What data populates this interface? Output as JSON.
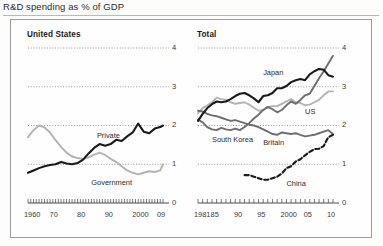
{
  "figure": {
    "title": "R&D spending as % of GDP"
  },
  "colors": {
    "black": "#1a1a1a",
    "dark_gray": "#6e6e6e",
    "light_gray": "#b3b3b3",
    "grid": "#8c8c8c",
    "axis": "#4d4d4d",
    "panel_border": "#9c9c9c",
    "text": "#2b2b2b"
  },
  "chart_data": [
    {
      "type": "line",
      "title": "United States",
      "xlabel": "",
      "ylabel": "",
      "xlim": [
        1960,
        2009
      ],
      "ylim": [
        0,
        4
      ],
      "yticks": [
        0,
        1,
        2,
        3,
        4
      ],
      "ytick_labels": [
        "0",
        "1",
        "2",
        "3",
        "4"
      ],
      "xticks": [
        1960,
        1970,
        1980,
        1990,
        2000,
        2009
      ],
      "xtick_labels": [
        "1960",
        "70",
        "80",
        "90",
        "2000",
        "09"
      ],
      "grid": "dotted horizontal at 1,2,3,4",
      "legend": "inline labels on lines",
      "series": [
        {
          "name": "Private",
          "color": "#1a1a1a",
          "style": "solid",
          "x": [
            1960,
            1962,
            1964,
            1966,
            1968,
            1970,
            1972,
            1974,
            1976,
            1978,
            1980,
            1982,
            1984,
            1986,
            1988,
            1990,
            1992,
            1994,
            1996,
            1998,
            2000,
            2002,
            2004,
            2006,
            2008,
            2009
          ],
          "values": [
            0.78,
            0.84,
            0.9,
            0.95,
            0.98,
            1.0,
            1.06,
            1.02,
            1.0,
            1.03,
            1.12,
            1.28,
            1.42,
            1.52,
            1.48,
            1.52,
            1.63,
            1.6,
            1.72,
            1.82,
            2.05,
            1.84,
            1.8,
            1.92,
            1.96,
            2.0
          ]
        },
        {
          "name": "Government",
          "color": "#b3b3b3",
          "style": "solid",
          "x": [
            1960,
            1962,
            1964,
            1966,
            1968,
            1970,
            1972,
            1974,
            1976,
            1978,
            1980,
            1982,
            1984,
            1986,
            1988,
            1990,
            1992,
            1994,
            1996,
            1998,
            2000,
            2002,
            2004,
            2006,
            2008,
            2009
          ],
          "values": [
            1.7,
            1.88,
            2.0,
            1.95,
            1.82,
            1.62,
            1.45,
            1.3,
            1.2,
            1.16,
            1.14,
            1.18,
            1.25,
            1.3,
            1.24,
            1.14,
            1.06,
            0.95,
            0.84,
            0.78,
            0.74,
            0.78,
            0.82,
            0.8,
            0.84,
            1.0
          ]
        }
      ]
    },
    {
      "type": "line",
      "title": "Total",
      "xlabel": "",
      "ylabel": "",
      "xlim": [
        1981,
        2010
      ],
      "ylim": [
        0,
        4
      ],
      "yticks": [
        0,
        1,
        2,
        3,
        4
      ],
      "ytick_labels": [
        "0",
        "1",
        "2",
        "3",
        "4"
      ],
      "xticks": [
        1981,
        1985,
        1990,
        1995,
        2000,
        2005,
        2010
      ],
      "xtick_labels": [
        "1981",
        "85",
        "90",
        "95",
        "2000",
        "05",
        "10"
      ],
      "grid": "dotted horizontal at 1,2,3,4",
      "legend": "inline labels on lines",
      "series": [
        {
          "name": "Japan",
          "color": "#1a1a1a",
          "style": "solid",
          "x": [
            1981,
            1982,
            1983,
            1984,
            1985,
            1986,
            1987,
            1988,
            1989,
            1990,
            1991,
            1992,
            1993,
            1994,
            1995,
            1996,
            1997,
            1998,
            1999,
            2000,
            2001,
            2002,
            2003,
            2004,
            2005,
            2006,
            2007,
            2008,
            2009,
            2010
          ],
          "values": [
            2.12,
            2.3,
            2.45,
            2.55,
            2.62,
            2.6,
            2.62,
            2.68,
            2.76,
            2.82,
            2.84,
            2.78,
            2.7,
            2.6,
            2.76,
            2.78,
            2.84,
            2.96,
            2.96,
            3.02,
            3.12,
            3.17,
            3.2,
            3.17,
            3.32,
            3.4,
            3.46,
            3.44,
            3.3,
            3.26
          ]
        },
        {
          "name": "US",
          "color": "#b3b3b3",
          "style": "solid",
          "x": [
            1981,
            1982,
            1983,
            1984,
            1985,
            1986,
            1987,
            1988,
            1989,
            1990,
            1991,
            1992,
            1993,
            1994,
            1995,
            1996,
            1997,
            1998,
            1999,
            2000,
            2001,
            2002,
            2003,
            2004,
            2005,
            2006,
            2007,
            2008,
            2009,
            2010
          ],
          "values": [
            2.32,
            2.45,
            2.52,
            2.6,
            2.72,
            2.68,
            2.66,
            2.6,
            2.56,
            2.58,
            2.6,
            2.54,
            2.46,
            2.38,
            2.4,
            2.48,
            2.5,
            2.5,
            2.56,
            2.62,
            2.68,
            2.6,
            2.58,
            2.52,
            2.54,
            2.6,
            2.66,
            2.78,
            2.88,
            2.88
          ]
        },
        {
          "name": "South Korea",
          "color": "#6e6e6e",
          "style": "solid",
          "x": [
            1981,
            1982,
            1983,
            1984,
            1985,
            1986,
            1987,
            1988,
            1989,
            1990,
            1991,
            1992,
            1993,
            1994,
            1995,
            1996,
            1997,
            1998,
            1999,
            2000,
            2001,
            2002,
            2003,
            2004,
            2005,
            2006,
            2007,
            2008,
            2009,
            2010
          ],
          "values": [
            2.15,
            2.08,
            1.96,
            1.9,
            1.88,
            1.94,
            1.9,
            1.88,
            1.92,
            1.88,
            1.96,
            2.06,
            2.18,
            2.28,
            2.4,
            2.48,
            2.42,
            2.34,
            2.4,
            2.52,
            2.62,
            2.56,
            2.66,
            2.78,
            2.82,
            3.02,
            3.22,
            3.4,
            3.6,
            3.8
          ]
        },
        {
          "name": "Britain",
          "color": "#6e6e6e",
          "style": "solid",
          "x": [
            1981,
            1982,
            1983,
            1984,
            1985,
            1986,
            1987,
            1988,
            1989,
            1990,
            1991,
            1992,
            1993,
            1994,
            1995,
            1996,
            1997,
            1998,
            1999,
            2000,
            2001,
            2002,
            2003,
            2004,
            2005,
            2006,
            2007,
            2008,
            2009,
            2010
          ],
          "values": [
            2.38,
            2.36,
            2.3,
            2.26,
            2.24,
            2.2,
            2.16,
            2.12,
            2.14,
            2.1,
            2.06,
            2.02,
            2.0,
            1.96,
            1.9,
            1.84,
            1.78,
            1.76,
            1.82,
            1.8,
            1.78,
            1.8,
            1.76,
            1.72,
            1.74,
            1.76,
            1.8,
            1.84,
            1.88,
            1.78
          ]
        },
        {
          "name": "China",
          "color": "#1a1a1a",
          "style": "dashed",
          "x": [
            1991,
            1992,
            1993,
            1994,
            1995,
            1996,
            1997,
            1998,
            1999,
            2000,
            2001,
            2002,
            2003,
            2004,
            2005,
            2006,
            2007,
            2008,
            2009,
            2010
          ],
          "values": [
            0.72,
            0.72,
            0.68,
            0.64,
            0.6,
            0.6,
            0.64,
            0.68,
            0.76,
            0.9,
            0.95,
            1.07,
            1.13,
            1.23,
            1.32,
            1.39,
            1.4,
            1.47,
            1.7,
            1.76
          ]
        }
      ],
      "series_labels": [
        {
          "name": "Japan",
          "x": 1995,
          "y": 3.35
        },
        {
          "name": "US",
          "x": 2004,
          "y": 2.35
        },
        {
          "name": "South Korea",
          "x": 1984,
          "y": 1.62
        },
        {
          "name": "Britain",
          "x": 1995,
          "y": 1.55
        },
        {
          "name": "China",
          "x": 2000,
          "y": 0.5
        }
      ]
    }
  ],
  "left_series_labels": [
    {
      "name": "Private",
      "x": 1985,
      "y": 1.72
    },
    {
      "name": "Government",
      "x": 1983,
      "y": 0.52
    }
  ]
}
